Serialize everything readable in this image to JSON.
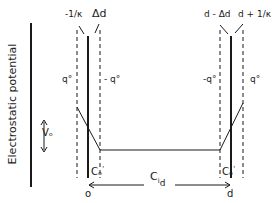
{
  "diagram": {
    "y_axis_label": "Electrostatic potential",
    "voltage_label": "Vₒ",
    "left_labels": {
      "outer": "-1/κ",
      "inner": "Δd",
      "charge_outside": "q°",
      "charge_inside": "- q°",
      "capacitance": "Cₒ",
      "capacitance_sup": "'",
      "position": "o"
    },
    "right_labels": {
      "inner": "d - Δd",
      "outer": "d + 1/κ",
      "charge_inside": "-q°",
      "charge_outside": "q°",
      "capacitance": "Cₒ",
      "capacitance_sup": "'",
      "position": "d"
    },
    "bulk_capacitance": "C",
    "bulk_capacitance_sub1": "i",
    "bulk_capacitance_sub2": "d"
  }
}
